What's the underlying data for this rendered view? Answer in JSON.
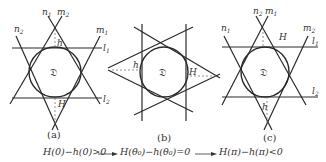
{
  "figure": {
    "panels": [
      {
        "id": "a",
        "caption": "(a)",
        "region_label": "𝔇",
        "line_labels": {
          "n1": "n",
          "n1_sub": "1",
          "m2": "m",
          "m2_sub": "2",
          "n2": "n",
          "n2_sub": "2",
          "m1": "m",
          "m1_sub": "1",
          "l1": "l",
          "l1_sub": "1",
          "l2": "l",
          "l2_sub": "2"
        },
        "small_height_label": "h",
        "big_height_label": "H"
      },
      {
        "id": "b",
        "caption": "(b)",
        "region_label": "𝔇",
        "small_height_label": "h",
        "big_height_label": "H"
      },
      {
        "id": "c",
        "caption": "(c)",
        "region_label": "𝔇",
        "line_labels": {
          "n2": "n",
          "n2_sub": "2",
          "m1": "m",
          "m1_sub": "1",
          "n1": "n",
          "n1_sub": "1",
          "m2": "m",
          "m2_sub": "2",
          "l1": "l",
          "l1_sub": "1",
          "l2": "l",
          "l2_sub": "2"
        },
        "big_height_label": "H",
        "small_height_label": "h"
      }
    ],
    "formula": {
      "part1": "H(0)−h(0)>0",
      "part2": "H(θ₀)−h(θ₀)=0",
      "part3": "H(π)−h(π)<0",
      "arrow": "⟶"
    }
  }
}
